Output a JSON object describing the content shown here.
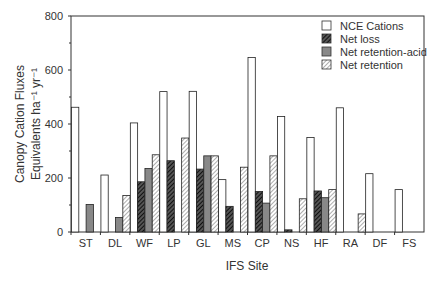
{
  "chart_data": {
    "type": "bar",
    "title": "",
    "xlabel": "IFS Site",
    "ylabel_line1": "Canopy Cation Fluxes",
    "ylabel_line2": "Equivalents ha⁻¹ yr⁻¹",
    "ylim": [
      0,
      800
    ],
    "yticks": [
      0,
      200,
      400,
      600,
      800
    ],
    "grid": false,
    "legend_position": "upper right",
    "categories": [
      "ST",
      "DL",
      "WF",
      "LP",
      "GL",
      "MS",
      "CP",
      "NS",
      "HF",
      "RA",
      "DF",
      "FS"
    ],
    "series": [
      {
        "name": "NCE Cations",
        "pattern": "open",
        "values": [
          462,
          211,
          404,
          520,
          521,
          194,
          646,
          428,
          350,
          460,
          216,
          157
        ]
      },
      {
        "name": "Net loss",
        "pattern": "dark-hatch",
        "values": [
          0,
          0,
          186,
          264,
          233,
          95,
          150,
          8,
          152,
          0,
          0,
          0
        ]
      },
      {
        "name": "Net retention-acid",
        "pattern": "gray-fill",
        "values": [
          102,
          54,
          235,
          0,
          282,
          0,
          107,
          0,
          127,
          0,
          0,
          0
        ]
      },
      {
        "name": "Net retention",
        "pattern": "light-hatch",
        "values": [
          0,
          135,
          286,
          348,
          282,
          240,
          282,
          123,
          157,
          67,
          0,
          0
        ]
      }
    ]
  }
}
